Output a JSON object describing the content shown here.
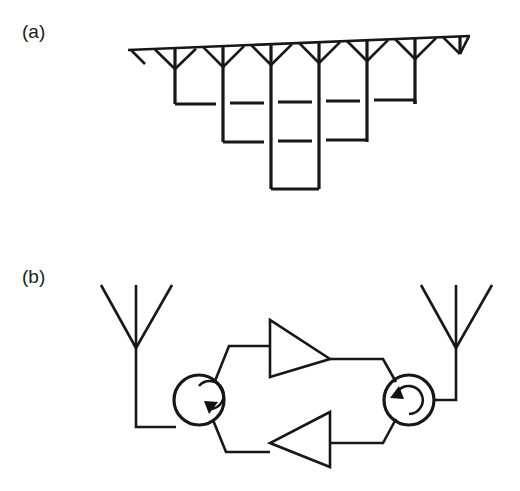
{
  "figure": {
    "background_color": "#ffffff",
    "line_color": "#171717",
    "width": 520,
    "height": 491,
    "panels": [
      {
        "id": "a",
        "label": "(a)",
        "label_x": 22,
        "label_y": 38,
        "title": "Corporate-fed V-dipole antenna array with nested transmission-line feed network",
        "type": "antenna-array",
        "feed_line": {
          "x1": 128,
          "y1": 50,
          "x2": 470,
          "y2": 36,
          "description": "main horizontal feed boom, slightly slanted upward to the right"
        },
        "element_count": 8,
        "elements": [
          {
            "index": 1,
            "apex_x": 175,
            "apex_y": 68,
            "left_x": 155,
            "right_x": 196,
            "top_y": 49,
            "drop_to_y": 104
          },
          {
            "index": 2,
            "apex_x": 227,
            "apex_y": 66,
            "left_x": 206,
            "right_x": 248,
            "top_y": 47,
            "drop_to_y": 142
          },
          {
            "index": 3,
            "apex_x": 276,
            "apex_y": 64,
            "left_x": 256,
            "right_x": 297,
            "top_y": 45,
            "drop_to_y": 189
          },
          {
            "index": 4,
            "apex_x": 324,
            "apex_y": 62,
            "left_x": 304,
            "right_x": 345,
            "top_y": 43,
            "drop_to_y": 189
          },
          {
            "index": 5,
            "apex_x": 372,
            "apex_y": 60,
            "left_x": 352,
            "right_x": 393,
            "top_y": 41,
            "drop_to_y": 142
          },
          {
            "index": 6,
            "apex_x": 420,
            "apex_y": 58,
            "left_x": 400,
            "right_x": 441,
            "top_y": 39,
            "drop_to_y": 104
          },
          {
            "index": 7,
            "apex_x": 251,
            "apex_y": 65,
            "left_x": 231,
            "right_x": 272,
            "top_y": 46,
            "drop_to_y": 0
          },
          {
            "index": 8,
            "apex_x": 300,
            "apex_y": 63,
            "left_x": 280,
            "right_x": 321,
            "top_y": 44,
            "drop_to_y": 0
          }
        ],
        "nested_loops": [
          {
            "level": 1,
            "left_x": 175,
            "right_x": 420,
            "bottom_y": 104
          },
          {
            "level": 2,
            "left_x": 227,
            "right_x": 372,
            "bottom_y": 142
          },
          {
            "level": 3,
            "left_x": 276,
            "right_x": 324,
            "bottom_y": 189
          }
        ]
      },
      {
        "id": "b",
        "label": "(b)",
        "label_x": 22,
        "label_y": 283,
        "title": "Bidirectional repeater: two dipole antennas, two circulators, two amplifiers",
        "type": "repeater-circuit",
        "antennas": [
          {
            "side": "left",
            "name": "left-dipole-antenna",
            "mast_x": 136,
            "mast_top_y": 286,
            "junction_y": 348,
            "mast_bottom_y": 384,
            "arm_left_x": 101,
            "arm_right_x": 172,
            "arm_top_y": 285
          },
          {
            "side": "right",
            "name": "right-dipole-antenna",
            "mast_x": 456,
            "mast_top_y": 286,
            "junction_y": 348,
            "mast_bottom_y": 384,
            "arm_left_x": 421,
            "arm_right_x": 492,
            "arm_top_y": 285
          }
        ],
        "circulators": [
          {
            "side": "left",
            "name": "left-circulator",
            "cx": 199,
            "cy": 400,
            "r": 25,
            "rotation": "clockwise",
            "arrow_position": "right"
          },
          {
            "side": "right",
            "name": "right-circulator",
            "cx": 409,
            "cy": 400,
            "r": 25,
            "rotation": "counter-clockwise",
            "arrow_position": "upper-left"
          }
        ],
        "amplifiers": [
          {
            "name": "upper-amplifier",
            "direction": "right",
            "tip_x": 330,
            "tip_y": 359,
            "back_x": 270,
            "top_y": 320,
            "bottom_y": 377,
            "path": "upper",
            "signal": "left-to-right"
          },
          {
            "name": "lower-amplifier",
            "direction": "left",
            "tip_x": 270,
            "tip_y": 443,
            "back_x": 330,
            "top_y": 412,
            "bottom_y": 467,
            "path": "lower",
            "signal": "right-to-left"
          }
        ],
        "connections": [
          {
            "from": "left-antenna-feed",
            "to": "left-circulator-west-port",
            "points": "136,384 136,427 176,427"
          },
          {
            "from": "left-circulator-north-port",
            "to": "upper-amplifier-input",
            "points": "215,381 230,346 270,346"
          },
          {
            "from": "upper-amplifier-output",
            "to": "right-circulator-north-port",
            "points": "330,359 382,359 395,381"
          },
          {
            "from": "left-circulator-south-port",
            "to": "lower-amplifier-output",
            "points": "213,421 226,452 270,452"
          },
          {
            "from": "lower-amplifier-input",
            "to": "right-circulator-south-port",
            "points": "330,443 382,443 395,419"
          },
          {
            "from": "right-circulator-east-port",
            "to": "right-antenna-feed",
            "points": "433,400 456,400 456,384"
          }
        ]
      }
    ]
  }
}
